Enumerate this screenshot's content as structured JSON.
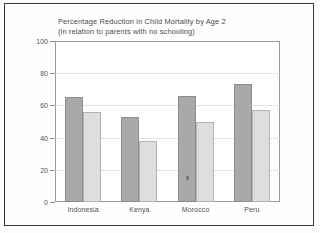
{
  "chart_data": {
    "type": "bar",
    "title": "Percentage Reduction in Child Mortality by Age 2\n(in relation to parents with no schooling)",
    "title_line1": "Percentage Reduction in Child Mortality by Age 2",
    "title_line2": "(in relation to parents with no schooling)",
    "xlabel": "",
    "ylabel": "",
    "ylim": [
      0,
      100
    ],
    "yticks": [
      0,
      20,
      40,
      60,
      80,
      100
    ],
    "grid": true,
    "legend_position": "top-center",
    "categories": [
      "Indonesia",
      "Kenya",
      "Morocco",
      "Peru"
    ],
    "series": [
      {
        "name": "Mother educated",
        "color": "#a9a9a9",
        "values": [
          65,
          53,
          66,
          73
        ]
      },
      {
        "name": "Father educated",
        "color": "#dedede",
        "values": [
          56,
          38,
          50,
          57
        ]
      }
    ]
  },
  "legend": {
    "items": [
      {
        "label": "Mother educated"
      },
      {
        "label": "Father educated"
      }
    ]
  },
  "colors": {
    "mother_bar": "#a9a9a9",
    "father_bar": "#dedede",
    "frame": "#9a9a9a",
    "text": "#4a4a4a",
    "page_border": "#3a3a3a"
  }
}
